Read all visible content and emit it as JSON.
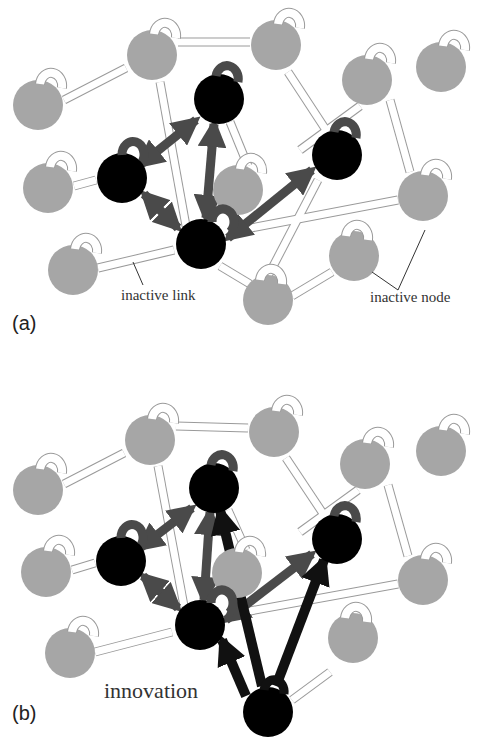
{
  "figure": {
    "colors": {
      "active_node": "#000000",
      "inactive_node": "#a6a6a6",
      "active_link": "#4a4a4a",
      "inactive_link_fill": "#ffffff",
      "inactive_link_stroke": "#9a9a9a",
      "innovation_link": "#111111"
    }
  },
  "panels": [
    {
      "id": "a",
      "label": "(a)",
      "annotations": {
        "inactive_link": "inactive link",
        "inactive_node": "inactive node"
      },
      "nodes": [
        {
          "id": "n1",
          "x": 38,
          "y": 105,
          "state": "inactive"
        },
        {
          "id": "n2",
          "x": 152,
          "y": 55,
          "state": "inactive"
        },
        {
          "id": "n3",
          "x": 276,
          "y": 45,
          "state": "inactive"
        },
        {
          "id": "n4",
          "x": 219,
          "y": 99,
          "state": "active"
        },
        {
          "id": "n5",
          "x": 367,
          "y": 80,
          "state": "inactive"
        },
        {
          "id": "n6",
          "x": 441,
          "y": 67,
          "state": "inactive"
        },
        {
          "id": "n7",
          "x": 48,
          "y": 188,
          "state": "inactive"
        },
        {
          "id": "n8",
          "x": 122,
          "y": 178,
          "state": "active"
        },
        {
          "id": "n9",
          "x": 238,
          "y": 190,
          "state": "inactive"
        },
        {
          "id": "n10",
          "x": 337,
          "y": 155,
          "state": "active"
        },
        {
          "id": "n11",
          "x": 423,
          "y": 196,
          "state": "inactive"
        },
        {
          "id": "n12",
          "x": 73,
          "y": 270,
          "state": "inactive"
        },
        {
          "id": "n13",
          "x": 201,
          "y": 244,
          "state": "active"
        },
        {
          "id": "n14",
          "x": 354,
          "y": 256,
          "state": "inactive"
        },
        {
          "id": "n15",
          "x": 268,
          "y": 300,
          "state": "inactive"
        }
      ]
    },
    {
      "id": "b",
      "label": "(b)",
      "annotations": {
        "innovation": "innovation"
      },
      "nodes": [
        {
          "id": "n1",
          "x": 38,
          "y": 490,
          "state": "inactive"
        },
        {
          "id": "n2",
          "x": 150,
          "y": 440,
          "state": "inactive"
        },
        {
          "id": "n3",
          "x": 274,
          "y": 432,
          "state": "inactive"
        },
        {
          "id": "n4",
          "x": 214,
          "y": 488,
          "state": "active"
        },
        {
          "id": "n5",
          "x": 365,
          "y": 464,
          "state": "inactive"
        },
        {
          "id": "n6",
          "x": 441,
          "y": 451,
          "state": "inactive"
        },
        {
          "id": "n7",
          "x": 46,
          "y": 572,
          "state": "inactive"
        },
        {
          "id": "n8",
          "x": 121,
          "y": 561,
          "state": "active"
        },
        {
          "id": "n9",
          "x": 237,
          "y": 573,
          "state": "inactive"
        },
        {
          "id": "n10",
          "x": 337,
          "y": 539,
          "state": "active"
        },
        {
          "id": "n11",
          "x": 423,
          "y": 580,
          "state": "inactive"
        },
        {
          "id": "n12",
          "x": 70,
          "y": 653,
          "state": "inactive"
        },
        {
          "id": "n13",
          "x": 200,
          "y": 625,
          "state": "active"
        },
        {
          "id": "n14",
          "x": 353,
          "y": 638,
          "state": "inactive"
        },
        {
          "id": "n15",
          "x": 268,
          "y": 712,
          "state": "active",
          "role": "innovation"
        }
      ]
    }
  ]
}
